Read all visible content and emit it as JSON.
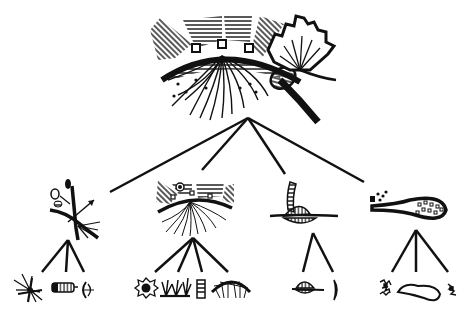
{
  "diagram": {
    "type": "tree",
    "background": "#ffffff",
    "ink": "#111111",
    "root": {
      "id": "root",
      "icon": "root-ecosystem-arc-with-fan-and-roots",
      "children": [
        {
          "id": "branch-1",
          "icon": "crossed-branches-with-buds",
          "children": [
            {
              "id": "leaf-1-1",
              "icon": "starburst-fan"
            },
            {
              "id": "leaf-1-2",
              "icon": "striped-capsule"
            },
            {
              "id": "leaf-1-3",
              "icon": "small-curved-seed"
            }
          ]
        },
        {
          "id": "branch-2",
          "icon": "mini-ecosystem-arc-with-roots",
          "children": [
            {
              "id": "leaf-2-1",
              "icon": "spiked-circle"
            },
            {
              "id": "leaf-2-2",
              "icon": "grass-tufts"
            },
            {
              "id": "leaf-2-3",
              "icon": "stacked-bars"
            },
            {
              "id": "leaf-2-4",
              "icon": "hairy-mound"
            }
          ]
        },
        {
          "id": "branch-3",
          "icon": "striped-spindle-with-spike",
          "children": [
            {
              "id": "leaf-3-1",
              "icon": "small-striped-spindle"
            },
            {
              "id": "leaf-3-2",
              "icon": "thin-curved-segment"
            }
          ]
        },
        {
          "id": "branch-4",
          "icon": "dotted-teardrop-bulb",
          "children": [
            {
              "id": "leaf-4-1",
              "icon": "scribbled-cluster"
            },
            {
              "id": "leaf-4-2",
              "icon": "outline-teardrop-loop"
            },
            {
              "id": "leaf-4-3",
              "icon": "small-scribble"
            }
          ]
        }
      ]
    }
  }
}
